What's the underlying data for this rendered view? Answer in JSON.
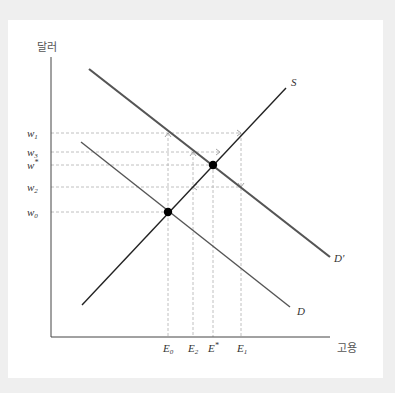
{
  "diagram": {
    "y_axis_label": "달러",
    "x_axis_label": "고용",
    "curves": {
      "supply": "S",
      "demand": "D",
      "demand_shifted": "D'"
    },
    "wage_labels": {
      "w1": "w",
      "w1_sub": "1",
      "w3": "w",
      "w3_sub": "3",
      "wstar": "w",
      "wstar_sup": "*",
      "w2": "w",
      "w2_sub": "2",
      "w0": "w",
      "w0_sub": "0"
    },
    "employment_labels": {
      "e0": "E",
      "e0_sub": "0",
      "e2": "E",
      "e2_sub": "2",
      "estar": "E",
      "estar_sup": "*",
      "e1": "E",
      "e1_sub": "1"
    },
    "colors": {
      "supply_line": "#222222",
      "demand_line": "#555555",
      "demand_shifted_line": "#555555",
      "dashed_line": "#aaaaaa",
      "axis": "#444444",
      "frame": "#efefef"
    }
  }
}
